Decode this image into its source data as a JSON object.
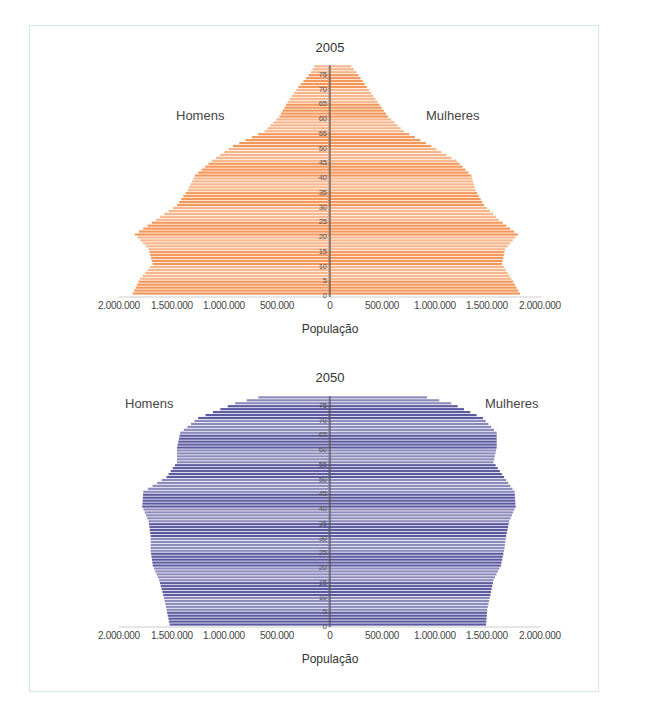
{
  "chart_data": [
    {
      "type": "bar",
      "subtype": "population-pyramid",
      "title": "2005",
      "xlabel": "População",
      "ylabel": "",
      "left_label": "Homens",
      "right_label": "Mulheres",
      "x_ticks": [
        "2.000.000",
        "1.500.000",
        "1.000.000",
        "500.000",
        "0",
        "500.000",
        "1.000.000",
        "1.500.000",
        "2.000.000"
      ],
      "y_ticks": [
        "0",
        "5",
        "10",
        "15",
        "20",
        "25",
        "30",
        "35",
        "40",
        "45",
        "50",
        "55",
        "60",
        "65",
        "70",
        "75"
      ],
      "xlim": [
        -2000000,
        2000000
      ],
      "color": "#f4975a",
      "age_keypoints": [
        0,
        5,
        10,
        15,
        20,
        25,
        30,
        35,
        40,
        45,
        50,
        55,
        60,
        65,
        70,
        75,
        77
      ],
      "series": [
        {
          "name": "Homens",
          "values": [
            1870000,
            1800000,
            1680000,
            1720000,
            1850000,
            1650000,
            1450000,
            1350000,
            1280000,
            1120000,
            920000,
            620000,
            480000,
            400000,
            300000,
            180000,
            150000
          ]
        },
        {
          "name": "Mulheres",
          "values": [
            1800000,
            1720000,
            1630000,
            1660000,
            1780000,
            1600000,
            1460000,
            1380000,
            1340000,
            1200000,
            960000,
            700000,
            550000,
            450000,
            350000,
            250000,
            200000
          ]
        }
      ]
    },
    {
      "type": "bar",
      "subtype": "population-pyramid",
      "title": "2050",
      "xlabel": "População",
      "ylabel": "",
      "left_label": "Homens",
      "right_label": "Mulheres",
      "x_ticks": [
        "2.000.000",
        "1.500.000",
        "1.000.000",
        "500.000",
        "0",
        "500.000",
        "1.000.000",
        "1.500.000",
        "2.000.000"
      ],
      "y_ticks": [
        "0",
        "5",
        "10",
        "15",
        "20",
        "25",
        "30",
        "35",
        "40",
        "45",
        "50",
        "55",
        "60",
        "65",
        "70",
        "75"
      ],
      "xlim": [
        -2000000,
        2000000
      ],
      "color": "#5d5aa0",
      "age_keypoints": [
        0,
        5,
        10,
        15,
        20,
        25,
        30,
        35,
        40,
        45,
        50,
        55,
        60,
        65,
        70,
        75,
        77
      ],
      "series": [
        {
          "name": "Homens",
          "values": [
            1520000,
            1550000,
            1580000,
            1620000,
            1680000,
            1700000,
            1700000,
            1720000,
            1780000,
            1770000,
            1550000,
            1450000,
            1450000,
            1420000,
            1250000,
            900000,
            680000
          ]
        },
        {
          "name": "Mulheres",
          "values": [
            1480000,
            1490000,
            1520000,
            1550000,
            1620000,
            1650000,
            1670000,
            1700000,
            1760000,
            1750000,
            1650000,
            1550000,
            1580000,
            1580000,
            1450000,
            1150000,
            920000
          ]
        }
      ]
    }
  ],
  "charts": [
    {
      "title": "2005",
      "left_label": "Homens",
      "right_label": "Mulheres",
      "xlabel": "População",
      "x_ticks": [
        "2.000.000",
        "1.500.000",
        "1.000.000",
        "500.000",
        "0",
        "500.000",
        "1.000.000",
        "1.500.000",
        "2.000.000"
      ]
    },
    {
      "title": "2050",
      "left_label": "Homens",
      "right_label": "Mulheres",
      "xlabel": "População",
      "x_ticks": [
        "2.000.000",
        "1.500.000",
        "1.000.000",
        "500.000",
        "0",
        "500.000",
        "1.000.000",
        "1.500.000",
        "2.000.000"
      ]
    }
  ]
}
